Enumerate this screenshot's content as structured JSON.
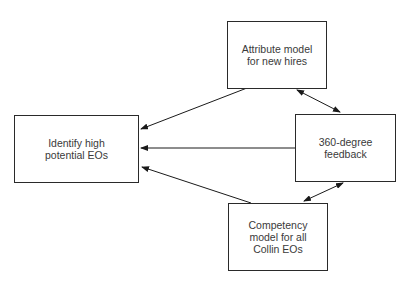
{
  "diagram": {
    "nodes": [
      {
        "id": "identify",
        "label": "Identify high\npotential EOs"
      },
      {
        "id": "attribute",
        "label": "Attribute model\nfor new hires"
      },
      {
        "id": "feedback",
        "label": "360-degree\nfeedback"
      },
      {
        "id": "competency",
        "label": "Competency\nmodel for all\nCollin EOs"
      }
    ],
    "edges": [
      {
        "from": "attribute",
        "to": "identify",
        "type": "directed"
      },
      {
        "from": "feedback",
        "to": "identify",
        "type": "directed"
      },
      {
        "from": "competency",
        "to": "identify",
        "type": "directed"
      },
      {
        "from": "attribute",
        "to": "feedback",
        "type": "bidirectional"
      },
      {
        "from": "competency",
        "to": "feedback",
        "type": "bidirectional"
      }
    ]
  }
}
